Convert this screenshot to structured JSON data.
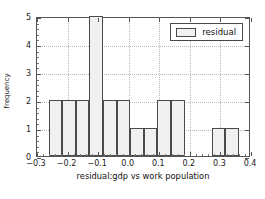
{
  "chart_data": {
    "type": "bar",
    "title": "",
    "xlabel": "residual:gdp vs work population",
    "ylabel": "frequency",
    "xlim": [
      -0.3,
      0.4
    ],
    "ylim": [
      0,
      5
    ],
    "grid": true,
    "legend": {
      "position": "upper right",
      "entries": [
        "residual"
      ]
    },
    "xticks": [
      -0.3,
      -0.2,
      -0.1,
      0.0,
      0.1,
      0.2,
      0.3,
      0.4
    ],
    "xticklabels": [
      "−0.3",
      "−0.2",
      "−0.1",
      "0.0",
      "0.1",
      "0.2",
      "0.3",
      "0.4"
    ],
    "yticks": [
      0,
      1,
      2,
      3,
      4,
      5
    ],
    "yticklabels": [
      "0",
      "1",
      "2",
      "3",
      "4",
      "5"
    ],
    "series": [
      {
        "name": "residual",
        "bin_edges": [
          -0.262,
          -0.2175,
          -0.173,
          -0.1285,
          -0.084,
          -0.0395,
          0.005,
          0.0495,
          0.094,
          0.1385,
          0.183,
          0.2275,
          0.272,
          0.3165,
          0.361
        ],
        "values": [
          2,
          2,
          2,
          5,
          2,
          2,
          1,
          1,
          2,
          2,
          0,
          0,
          1,
          1
        ],
        "facecolor": "#f0f0f0",
        "edgecolor": "#4a4a4a"
      }
    ]
  },
  "legend": {
    "label": "residual"
  },
  "axes": {
    "xtitle": "residual:gdp vs work population",
    "ytitle": "frequency"
  }
}
